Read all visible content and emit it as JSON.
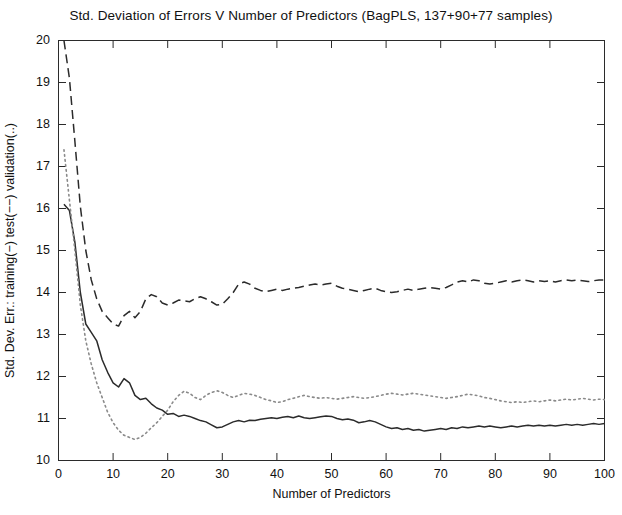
{
  "chart_data": {
    "type": "line",
    "title": "Std. Deviation of Errors V Number of Predictors (BagPLS, 137+90+77 samples)",
    "xlabel": "Number of Predictors",
    "ylabel": "Std. Dev. Err.: training(−)  test(−−)  validation(..)",
    "xlim": [
      0,
      100
    ],
    "ylim": [
      10,
      20
    ],
    "xticks": [
      0,
      10,
      20,
      30,
      40,
      50,
      60,
      70,
      80,
      90,
      100
    ],
    "yticks": [
      10,
      11,
      12,
      13,
      14,
      15,
      16,
      17,
      18,
      19,
      20
    ],
    "grid": false,
    "legend": "encoded-in-ylabel",
    "x": [
      1,
      2,
      3,
      4,
      5,
      6,
      7,
      8,
      9,
      10,
      11,
      12,
      13,
      14,
      15,
      16,
      17,
      18,
      19,
      20,
      21,
      22,
      23,
      24,
      25,
      26,
      27,
      28,
      29,
      30,
      31,
      32,
      33,
      34,
      35,
      36,
      37,
      38,
      39,
      40,
      41,
      42,
      43,
      44,
      45,
      46,
      47,
      48,
      49,
      50,
      51,
      52,
      53,
      54,
      55,
      56,
      57,
      58,
      59,
      60,
      61,
      62,
      63,
      64,
      65,
      66,
      67,
      68,
      69,
      70,
      71,
      72,
      73,
      74,
      75,
      76,
      77,
      78,
      79,
      80,
      81,
      82,
      83,
      84,
      85,
      86,
      87,
      88,
      89,
      90,
      91,
      92,
      93,
      94,
      95,
      96,
      97,
      98,
      99,
      100
    ],
    "series": [
      {
        "name": "training",
        "style": "solid",
        "color": "#2b2b2b",
        "values": [
          16.1,
          15.95,
          15.2,
          14.0,
          13.25,
          13.05,
          12.85,
          12.4,
          12.1,
          11.85,
          11.75,
          11.95,
          11.85,
          11.55,
          11.45,
          11.48,
          11.35,
          11.25,
          11.2,
          11.1,
          11.12,
          11.05,
          11.08,
          11.05,
          11.0,
          10.95,
          10.92,
          10.85,
          10.78,
          10.8,
          10.86,
          10.92,
          10.95,
          10.92,
          10.96,
          10.95,
          10.98,
          11.0,
          11.02,
          11.0,
          11.03,
          11.05,
          11.02,
          11.06,
          11.02,
          11.0,
          11.02,
          11.04,
          11.06,
          11.05,
          11.0,
          10.97,
          10.99,
          10.96,
          10.9,
          10.92,
          10.95,
          10.92,
          10.86,
          10.8,
          10.76,
          10.78,
          10.74,
          10.76,
          10.72,
          10.74,
          10.7,
          10.72,
          10.74,
          10.76,
          10.74,
          10.78,
          10.76,
          10.8,
          10.78,
          10.8,
          10.82,
          10.8,
          10.82,
          10.8,
          10.78,
          10.8,
          10.82,
          10.8,
          10.82,
          10.84,
          10.82,
          10.84,
          10.82,
          10.84,
          10.82,
          10.84,
          10.86,
          10.84,
          10.86,
          10.84,
          10.86,
          10.88,
          10.86,
          10.88
        ]
      },
      {
        "name": "test",
        "style": "dashed",
        "color": "#2b2b2b",
        "values": [
          20.0,
          19.1,
          17.6,
          16.05,
          15.0,
          14.3,
          13.85,
          13.55,
          13.4,
          13.25,
          13.2,
          13.45,
          13.55,
          13.4,
          13.55,
          13.85,
          13.95,
          13.9,
          13.75,
          13.7,
          13.75,
          13.82,
          13.8,
          13.78,
          13.85,
          13.9,
          13.85,
          13.78,
          13.7,
          13.72,
          13.85,
          14.0,
          14.2,
          14.25,
          14.2,
          14.1,
          14.05,
          14.02,
          14.05,
          14.08,
          14.05,
          14.08,
          14.1,
          14.12,
          14.15,
          14.18,
          14.2,
          14.18,
          14.2,
          14.22,
          14.15,
          14.1,
          14.08,
          14.05,
          14.02,
          14.05,
          14.08,
          14.1,
          14.05,
          14.02,
          14.0,
          14.02,
          14.05,
          14.08,
          14.05,
          14.08,
          14.1,
          14.12,
          14.1,
          14.08,
          14.12,
          14.18,
          14.25,
          14.28,
          14.25,
          14.3,
          14.28,
          14.22,
          14.2,
          14.22,
          14.25,
          14.28,
          14.25,
          14.28,
          14.3,
          14.28,
          14.25,
          14.28,
          14.26,
          14.28,
          14.25,
          14.28,
          14.3,
          14.28,
          14.3,
          14.28,
          14.26,
          14.28,
          14.3,
          14.3
        ]
      },
      {
        "name": "validation",
        "style": "dotted",
        "color": "#8a8a8a",
        "values": [
          17.4,
          16.2,
          15.0,
          13.7,
          12.85,
          12.3,
          11.85,
          11.5,
          11.15,
          10.9,
          10.72,
          10.6,
          10.55,
          10.5,
          10.55,
          10.65,
          10.78,
          10.9,
          11.05,
          11.2,
          11.4,
          11.55,
          11.65,
          11.6,
          11.5,
          11.45,
          11.55,
          11.62,
          11.66,
          11.62,
          11.55,
          11.5,
          11.55,
          11.6,
          11.58,
          11.55,
          11.5,
          11.45,
          11.42,
          11.38,
          11.4,
          11.45,
          11.48,
          11.52,
          11.55,
          11.52,
          11.5,
          11.48,
          11.5,
          11.48,
          11.46,
          11.48,
          11.5,
          11.52,
          11.5,
          11.48,
          11.5,
          11.52,
          11.55,
          11.58,
          11.6,
          11.58,
          11.56,
          11.58,
          11.6,
          11.58,
          11.56,
          11.54,
          11.52,
          11.5,
          11.48,
          11.5,
          11.52,
          11.55,
          11.58,
          11.56,
          11.54,
          11.5,
          11.48,
          11.45,
          11.42,
          11.4,
          11.38,
          11.4,
          11.38,
          11.4,
          11.42,
          11.4,
          11.42,
          11.44,
          11.42,
          11.44,
          11.46,
          11.44,
          11.46,
          11.48,
          11.46,
          11.44,
          11.46,
          11.45
        ]
      }
    ]
  }
}
